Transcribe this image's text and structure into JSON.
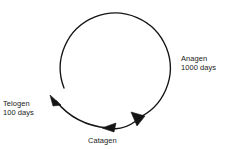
{
  "diagram": {
    "type": "cycle",
    "background_color": "#ffffff",
    "stroke_color": "#141414",
    "text_color": "#1a1a1a",
    "phases": [
      {
        "id": "anagen",
        "name": "Anagen",
        "duration": "1000 days",
        "position": "right"
      },
      {
        "id": "catagen",
        "name": "Catagen",
        "duration": "",
        "position": "bottom"
      },
      {
        "id": "telogen",
        "name": "Telogen",
        "duration": "100 days",
        "position": "left"
      }
    ]
  }
}
